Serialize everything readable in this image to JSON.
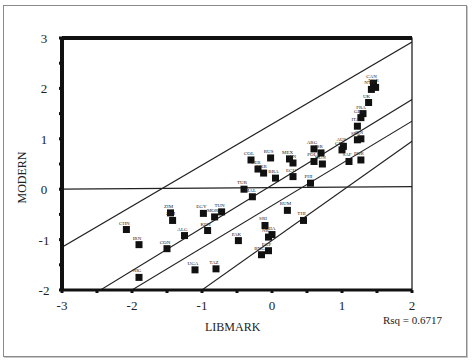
{
  "chart_data": {
    "type": "scatter",
    "title": "",
    "xlabel": "LIBMARK",
    "ylabel": "MODERN",
    "xlim": [
      -3,
      2
    ],
    "ylim": [
      -2,
      3
    ],
    "x_ticks": [
      "-3",
      "-2",
      "-1",
      "0",
      "1",
      "2"
    ],
    "y_ticks": [
      "3",
      "2",
      "1",
      "0",
      "-1",
      "-2"
    ],
    "annotation": "Rsq = 0.6717",
    "grid": false,
    "legend": "none",
    "points": [
      {
        "label": "CAN",
        "x": 1.45,
        "y": 2.1
      },
      {
        "label": "NOR",
        "x": 1.48,
        "y": 2.02
      },
      {
        "label": "NTH",
        "x": 1.42,
        "y": 1.98
      },
      {
        "label": "UK",
        "x": 1.38,
        "y": 1.72
      },
      {
        "label": "FRA",
        "x": 1.3,
        "y": 1.5
      },
      {
        "label": "GER",
        "x": 1.27,
        "y": 1.42
      },
      {
        "label": "ITA",
        "x": 1.22,
        "y": 1.25
      },
      {
        "label": "JPN",
        "x": 1.27,
        "y": 1.0
      },
      {
        "label": "SPA",
        "x": 1.22,
        "y": 0.98
      },
      {
        "label": "ARG",
        "x": 0.6,
        "y": 0.8
      },
      {
        "label": "ISR",
        "x": 0.7,
        "y": 0.72
      },
      {
        "label": "POL",
        "x": 0.6,
        "y": 0.55
      },
      {
        "label": "HUN",
        "x": 0.72,
        "y": 0.5
      },
      {
        "label": "AUS",
        "x": 1.02,
        "y": 0.85
      },
      {
        "label": "GRE",
        "x": 1.0,
        "y": 0.78
      },
      {
        "label": "SAF",
        "x": 1.1,
        "y": 0.55
      },
      {
        "label": "POR",
        "x": 1.27,
        "y": 0.58
      },
      {
        "label": "COL",
        "x": -0.3,
        "y": 0.58
      },
      {
        "label": "RUS",
        "x": -0.02,
        "y": 0.62
      },
      {
        "label": "MEX",
        "x": 0.25,
        "y": 0.6
      },
      {
        "label": "VEN",
        "x": 0.3,
        "y": 0.52
      },
      {
        "label": "PER",
        "x": -0.2,
        "y": 0.4
      },
      {
        "label": "UKR",
        "x": -0.12,
        "y": 0.32
      },
      {
        "label": "BRA",
        "x": 0.05,
        "y": 0.22
      },
      {
        "label": "ECU",
        "x": 0.3,
        "y": 0.25
      },
      {
        "label": "PHI",
        "x": 0.55,
        "y": 0.12
      },
      {
        "label": "TUR",
        "x": -0.4,
        "y": 0.0
      },
      {
        "label": "MAL",
        "x": -0.28,
        "y": -0.15
      },
      {
        "label": "RUM",
        "x": 0.22,
        "y": -0.42
      },
      {
        "label": "THI",
        "x": 0.45,
        "y": -0.62
      },
      {
        "label": "TUN",
        "x": -0.72,
        "y": -0.45
      },
      {
        "label": "EGY",
        "x": -0.98,
        "y": -0.48
      },
      {
        "label": "MOR",
        "x": -0.82,
        "y": -0.55
      },
      {
        "label": "ZIM",
        "x": -1.45,
        "y": -0.47
      },
      {
        "label": "ZIM2",
        "x": -1.42,
        "y": -0.62
      },
      {
        "label": "CHN",
        "x": -2.08,
        "y": -0.8
      },
      {
        "label": "IRN",
        "x": -1.9,
        "y": -1.1
      },
      {
        "label": "ALG",
        "x": -1.25,
        "y": -0.92
      },
      {
        "label": "CON",
        "x": -1.5,
        "y": -1.18
      },
      {
        "label": "KEN",
        "x": -0.92,
        "y": -0.82
      },
      {
        "label": "SRI",
        "x": -0.1,
        "y": -0.72
      },
      {
        "label": "PAK",
        "x": -0.48,
        "y": -1.02
      },
      {
        "label": "GHA",
        "x": 0.0,
        "y": -0.9
      },
      {
        "label": "NIG",
        "x": -0.05,
        "y": -0.95
      },
      {
        "label": "BNG",
        "x": -0.15,
        "y": -1.3
      },
      {
        "label": "EGP",
        "x": -0.05,
        "y": -1.22
      },
      {
        "label": "NIG2",
        "x": -1.9,
        "y": -1.75
      },
      {
        "label": "UGA",
        "x": -1.1,
        "y": -1.6
      },
      {
        "label": "TAZ",
        "x": -0.8,
        "y": -1.58
      }
    ],
    "lines": [
      {
        "name": "upper-95-individual",
        "x": [
          -3,
          2
        ],
        "y": [
          -1.15,
          2.92
        ]
      },
      {
        "name": "upper-95-mean",
        "x": [
          -2.45,
          2
        ],
        "y": [
          -2.0,
          1.78
        ]
      },
      {
        "name": "regression-fit",
        "x": [
          -2.0,
          2
        ],
        "y": [
          -2.0,
          1.35
        ]
      },
      {
        "name": "lower-95-mean",
        "x": [
          -1.0,
          2
        ],
        "y": [
          -2.0,
          0.95
        ]
      },
      {
        "name": "reference-zero",
        "x": [
          -3,
          2
        ],
        "y": [
          0.0,
          0.05
        ]
      }
    ]
  },
  "labels": {
    "xlabel": "LIBMARK",
    "ylabel": "MODERN",
    "rsq": "Rsq = 0.6717"
  }
}
